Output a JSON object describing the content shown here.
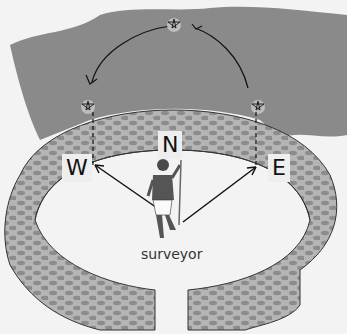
{
  "diagram": {
    "title": "",
    "labels": {
      "north": "N",
      "west": "W",
      "east": "E",
      "figure": "surveyor"
    },
    "elements": [
      "sky-region",
      "star-path-arc",
      "star-east-rising",
      "star-zenith",
      "star-west-setting",
      "circular-wall",
      "surveyor-figure",
      "sightline-west",
      "sightline-east"
    ],
    "colors": {
      "sky": "#8a8a8a",
      "wall": "#b3b3b3",
      "stones": "#8c8c8c",
      "ground": "#f3f3f3",
      "ink": "#111111"
    }
  }
}
